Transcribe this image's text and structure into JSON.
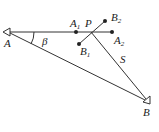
{
  "diagram": {
    "points": {
      "A": {
        "label": "A",
        "x": 8,
        "y": 32
      },
      "B": {
        "label": "B",
        "x": 147,
        "y": 101
      },
      "P": {
        "label": "P",
        "x": 91,
        "y": 32
      },
      "A1": {
        "label": "A",
        "sub": "1",
        "x": 76,
        "y": 32
      },
      "A2": {
        "label": "A",
        "sub": "2",
        "x": 112,
        "y": 32
      },
      "B1": {
        "label": "B",
        "sub": "1",
        "x": 79,
        "y": 44
      },
      "B2": {
        "label": "B",
        "sub": "2",
        "x": 105,
        "y": 21
      }
    },
    "angle_label": "β",
    "side_label": "S",
    "colors": {
      "line": "#333333",
      "text": "#222222",
      "background": "#ffffff"
    }
  }
}
